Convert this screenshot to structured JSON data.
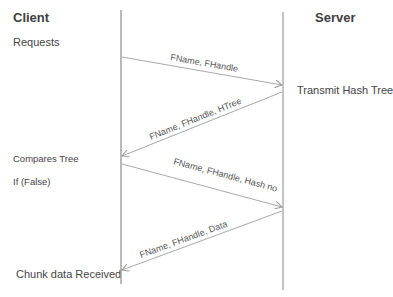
{
  "diagram": {
    "type": "sequence",
    "participants": [
      {
        "name": "Client",
        "x": 121
      },
      {
        "name": "Server",
        "x": 283
      }
    ],
    "client_notes": {
      "requests": "Requests",
      "compares_tree": "Compares Tree",
      "if_false": "If (False)",
      "chunk_received": "Chunk data Received"
    },
    "server_notes": {
      "transmit": "Transmit Hash Tree"
    },
    "messages": [
      {
        "from": "Client",
        "to": "Server",
        "label": "FName, FHandle"
      },
      {
        "from": "Server",
        "to": "Client",
        "label": "FName, FHandle, HTree"
      },
      {
        "from": "Client",
        "to": "Server",
        "label": "FName, FHandle, Hash no"
      },
      {
        "from": "Server",
        "to": "Client",
        "label": "FName, FHandle, Data"
      }
    ],
    "colors": {
      "lifeline": "#8a8a8a",
      "arrow": "#a8a8a8",
      "text": "#404040"
    }
  }
}
